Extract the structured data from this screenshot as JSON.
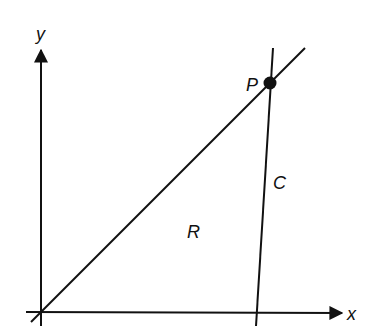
{
  "diagram": {
    "axes": {
      "x_label": "x",
      "y_label": "y"
    },
    "labels": {
      "point": "P",
      "curve": "C",
      "region": "R"
    },
    "colors": {
      "stroke": "#111111",
      "background": "#ffffff"
    }
  }
}
